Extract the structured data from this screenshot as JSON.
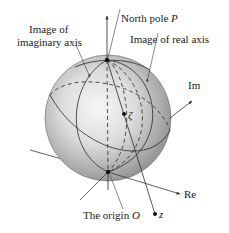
{
  "diagram": {
    "type": "riemann-sphere-stereographic-projection",
    "labels": {
      "imaginary_axis_image_line1": "Image of",
      "imaginary_axis_image_line2": "imaginary axis",
      "north_pole": "North pole ",
      "north_pole_symbol": "P",
      "real_axis_image": "Image of real axis",
      "im_axis": "Im",
      "re_axis": "Re",
      "origin": "The origin ",
      "origin_symbol": "O",
      "zeta": "ζ",
      "z": "z"
    },
    "points": [
      {
        "name": "north-pole-P",
        "x": 107,
        "y": 60
      },
      {
        "name": "origin-O",
        "x": 108,
        "y": 172
      },
      {
        "name": "zeta",
        "x": 124,
        "y": 114
      },
      {
        "name": "z",
        "x": 155,
        "y": 214
      }
    ],
    "colors": {
      "sphere_light": "#f2f2f2",
      "sphere_dark": "#8a8a8a",
      "line": "#2a2a2a",
      "text": "#1a1a1a",
      "background": "#ffffff"
    }
  }
}
